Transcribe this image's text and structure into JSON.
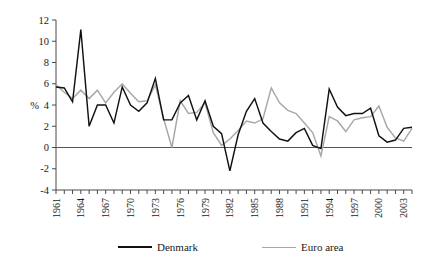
{
  "chart_data": {
    "type": "line",
    "title": "",
    "xlabel": "",
    "ylabel": "%",
    "ylim": [
      -4,
      12
    ],
    "ytick_step": 2,
    "yticks": [
      -4,
      -2,
      0,
      2,
      4,
      6,
      8,
      10,
      12
    ],
    "grid": false,
    "zero_line": true,
    "legend_position": "bottom",
    "x": [
      1961,
      1962,
      1963,
      1964,
      1965,
      1966,
      1967,
      1968,
      1969,
      1970,
      1971,
      1972,
      1973,
      1974,
      1975,
      1976,
      1977,
      1978,
      1979,
      1980,
      1981,
      1982,
      1983,
      1984,
      1985,
      1986,
      1987,
      1988,
      1989,
      1990,
      1991,
      1992,
      1993,
      1994,
      1995,
      1996,
      1997,
      1998,
      1999,
      2000,
      2001,
      2002,
      2003,
      2004
    ],
    "xtick_labels": [
      "1961",
      "1964",
      "1967",
      "1970",
      "1973",
      "1976",
      "1979",
      "1982",
      "1985",
      "1988",
      "1991",
      "1994",
      "1997",
      "2000",
      "2003"
    ],
    "xtick_step": 3,
    "series": [
      {
        "name": "Denmark",
        "color": "#111111",
        "values": [
          5.7,
          5.6,
          4.3,
          11.1,
          2.0,
          4.0,
          4.0,
          2.3,
          5.7,
          4.0,
          3.4,
          4.2,
          6.5,
          2.6,
          2.6,
          4.2,
          4.9,
          2.6,
          4.4,
          2.0,
          1.3,
          -2.2,
          1.2,
          3.4,
          4.6,
          2.3,
          1.5,
          0.8,
          0.6,
          1.4,
          1.8,
          0.2,
          -0.1,
          5.5,
          3.8,
          3.0,
          3.2,
          3.2,
          3.7,
          1.1,
          0.5,
          0.7,
          1.8,
          1.9
        ]
      },
      {
        "name": "Euro area",
        "color": "#a8a8a8",
        "values": [
          5.9,
          5.2,
          4.6,
          5.4,
          4.6,
          5.4,
          4.2,
          5.2,
          6.0,
          5.1,
          4.3,
          4.4,
          5.9,
          2.7,
          0.0,
          4.4,
          3.2,
          3.3,
          4.2,
          1.4,
          0.2,
          0.8,
          1.6,
          2.5,
          2.3,
          2.7,
          5.6,
          4.2,
          3.5,
          3.2,
          2.3,
          1.4,
          -0.8,
          2.9,
          2.5,
          1.5,
          2.6,
          2.8,
          2.9,
          3.9,
          1.9,
          0.9,
          0.6,
          1.8
        ]
      }
    ]
  },
  "legend": {
    "items": [
      {
        "label": "Denmark"
      },
      {
        "label": "Euro area"
      }
    ]
  },
  "axis": {
    "y_title": "%"
  }
}
